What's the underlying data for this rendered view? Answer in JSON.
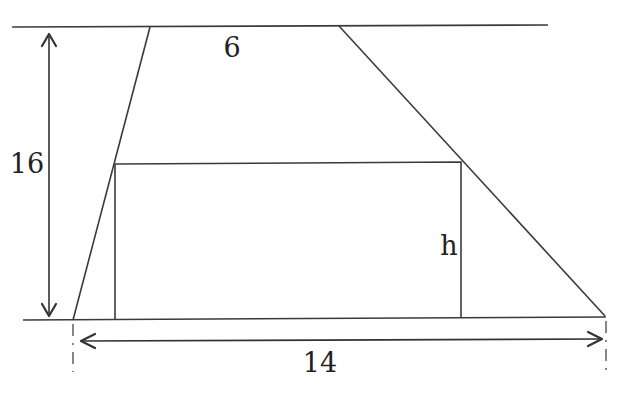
{
  "diagram": {
    "type": "geometry",
    "colors": {
      "stroke": "#3a3a3a",
      "text": "#222222",
      "background": "#ffffff"
    },
    "labels": {
      "top_base": "6",
      "height": "16",
      "rect_height": "h",
      "bottom_base": "14"
    },
    "top_line": {
      "x1": 12,
      "y1": 27,
      "x2": 548,
      "y2": 25
    },
    "bottom_line": {
      "x1": 23,
      "y1": 320,
      "x2": 606,
      "y2": 317
    },
    "trapezoid": {
      "top_left": [
        150,
        27
      ],
      "top_right": [
        339,
        26
      ],
      "bottom_left": [
        73,
        320
      ],
      "bottom_right": [
        605,
        316
      ]
    },
    "rectangle": {
      "x": 115,
      "y": 163,
      "width": 346,
      "height": 155
    },
    "height_arrow": {
      "x": 49,
      "y_top": 34,
      "y_bottom": 316
    },
    "width_arrow": {
      "y": 341,
      "x_left": 80,
      "x_right": 602
    }
  }
}
